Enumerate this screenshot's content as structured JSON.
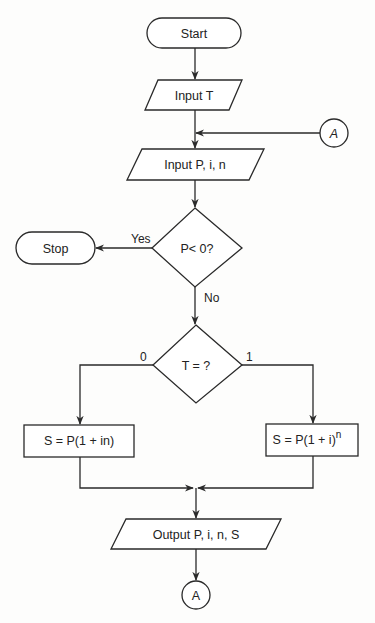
{
  "flowchart": {
    "nodes": {
      "start": {
        "type": "terminal",
        "label": "Start"
      },
      "input_t": {
        "type": "io",
        "label": "Input T"
      },
      "input_pin": {
        "type": "io",
        "label": "Input P, i, n"
      },
      "decision_p": {
        "type": "decision",
        "label": "P< 0?"
      },
      "stop": {
        "type": "terminal",
        "label": "Stop"
      },
      "decision_t": {
        "type": "decision",
        "label": "T = ?"
      },
      "simple": {
        "type": "process",
        "label": "S = P(1 + in)"
      },
      "compound": {
        "type": "process",
        "label": "S = P(1 + i)",
        "superscript": "n"
      },
      "output": {
        "type": "io",
        "label": "Output P, i, n, S"
      },
      "connector_in": {
        "type": "connector",
        "label": "A"
      },
      "connector_out": {
        "type": "connector",
        "label": "A"
      }
    },
    "edge_labels": {
      "yes": "Yes",
      "no": "No",
      "zero": "0",
      "one": "1"
    },
    "colors": {
      "stroke": "#2a2a2a",
      "fill": "#ffffff",
      "background": "#fdfdfc"
    }
  }
}
